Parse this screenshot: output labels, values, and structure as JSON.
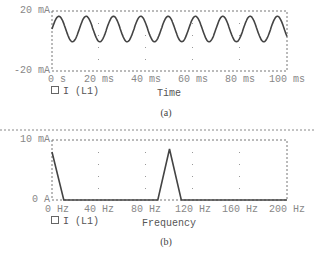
{
  "chart_data": [
    {
      "type": "line",
      "caption": "(a)",
      "title": "",
      "xlabel": "Time",
      "ylabel": "",
      "x_unit": "ms",
      "y_unit": "mA",
      "xlim": [
        0,
        100
      ],
      "ylim": [
        -20,
        20
      ],
      "x_ticks": [
        "0 s",
        "20 ms",
        "40 ms",
        "60 ms",
        "80 ms",
        "100 ms"
      ],
      "y_ticks": [
        "20 mA",
        "-20 mA"
      ],
      "grid": "dotted vertical marks",
      "legend": [
        "I (L1)"
      ],
      "legend_position": "bottom-left",
      "series": [
        {
          "name": "I (L1)",
          "kind": "sinusoid",
          "dc_offset_mA": 8,
          "amplitude_mA": 8.5,
          "cycles_in_window": 8.6,
          "min_mA": 0,
          "max_mA": 17
        }
      ]
    },
    {
      "type": "line",
      "caption": "(b)",
      "title": "",
      "xlabel": "Frequency",
      "ylabel": "",
      "x_unit": "Hz",
      "y_unit": "mA",
      "xlim": [
        0,
        200
      ],
      "ylim": [
        0,
        10
      ],
      "x_ticks": [
        "0 Hz",
        "40 Hz",
        "80 Hz",
        "120 Hz",
        "160 Hz",
        "200 Hz"
      ],
      "y_ticks": [
        "10 mA",
        "0 A"
      ],
      "grid": "dotted vertical marks",
      "legend": [
        "I (L1)"
      ],
      "legend_position": "bottom-left",
      "series": [
        {
          "name": "I (L1)",
          "x": [
            0,
            10,
            90,
            100,
            110,
            200
          ],
          "values": [
            8,
            0,
            0,
            8.5,
            0,
            0
          ]
        }
      ]
    }
  ],
  "plot_a": {
    "y_top": "20 mA",
    "y_bottom": "-20 mA",
    "x_ticks": [
      "0 s",
      "20 ms",
      "40 ms",
      "60 ms",
      "80 ms",
      "100 ms"
    ],
    "legend_label": "I (L1)",
    "axis_title": "Time",
    "caption": "(a)"
  },
  "plot_b": {
    "y_top": "10 mA",
    "y_bottom": "0 A",
    "x_ticks": [
      "0 Hz",
      "40 Hz",
      "80 Hz",
      "120 Hz",
      "160 Hz",
      "200 Hz"
    ],
    "legend_label": "I (L1)",
    "axis_title": "Frequency",
    "caption": "(b)"
  },
  "colors": {
    "trace": "#444444",
    "frame": "#777777",
    "text": "#888888"
  }
}
